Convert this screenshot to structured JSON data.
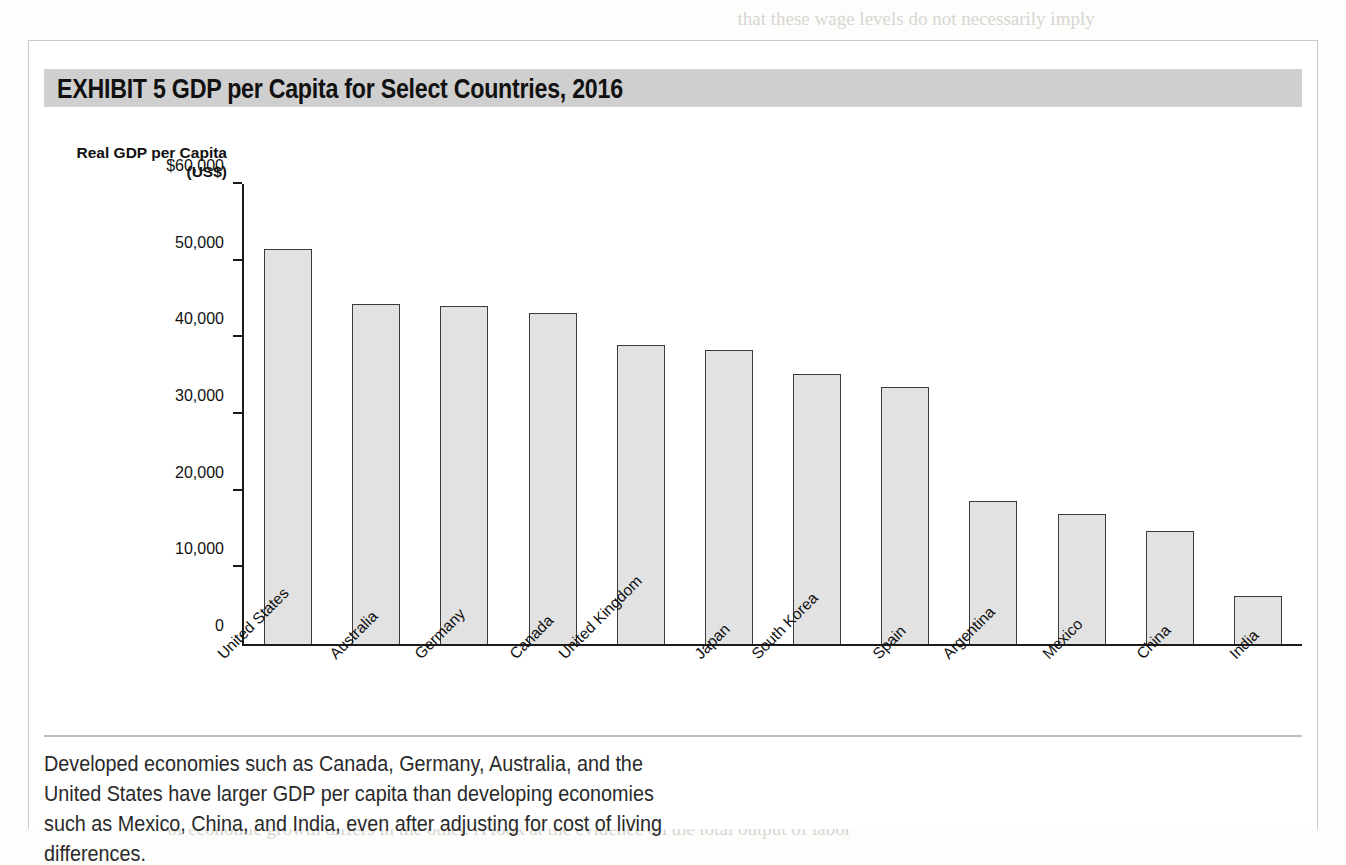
{
  "exhibit": {
    "title": "EXHIBIT 5   GDP per Capita for Select Countries, 2016",
    "header_bg": "#cfcfcf",
    "caption": "Developed economies such as Canada, Germany, Australia, and the United States have larger GDP per capita than developing economies such as Mexico, China, and India, even after adjusting for cost of living differences."
  },
  "axis": {
    "ylabel_line1": "Real GDP per Capita",
    "ylabel_line2": "(US$)",
    "tick_labels": [
      "$60,000",
      "50,000",
      "40,000",
      "30,000",
      "20,000",
      "10,000",
      "0"
    ]
  },
  "colors": {
    "bar_fill": "#e2e2e2",
    "bar_stroke": "#3a3a3a",
    "axis": "#1b1b1b"
  },
  "chart_data": {
    "type": "bar",
    "title": "GDP per Capita for Select Countries, 2016",
    "xlabel": "",
    "ylabel": "Real GDP per Capita (US$)",
    "ylim": [
      0,
      60000
    ],
    "ytick_values": [
      60000,
      50000,
      40000,
      30000,
      20000,
      10000,
      0
    ],
    "grid": false,
    "legend": "none",
    "categories": [
      "United States",
      "Australia",
      "Germany",
      "Canada",
      "United Kingdom",
      "Japan",
      "South Korea",
      "Spain",
      "Argentina",
      "Mexico",
      "China",
      "India"
    ],
    "values": [
      51500,
      44400,
      44100,
      43200,
      39000,
      38400,
      35200,
      33500,
      18700,
      17000,
      14700,
      6300
    ]
  },
  "ghost_text": "                                                                                                                                  that these wage levels do not necessarily imply\n\n\n\n\n\n\n\n\n\n\n\n\n\n\n\n\n\n\n\n\n\n\n\n\n                    and a relatively high standard of living in the\n          a matter of debate. In fact, this has had wide ranging interest among economists\n          of economic growth differs in the other. A look at the evidence on the total output of labor"
}
